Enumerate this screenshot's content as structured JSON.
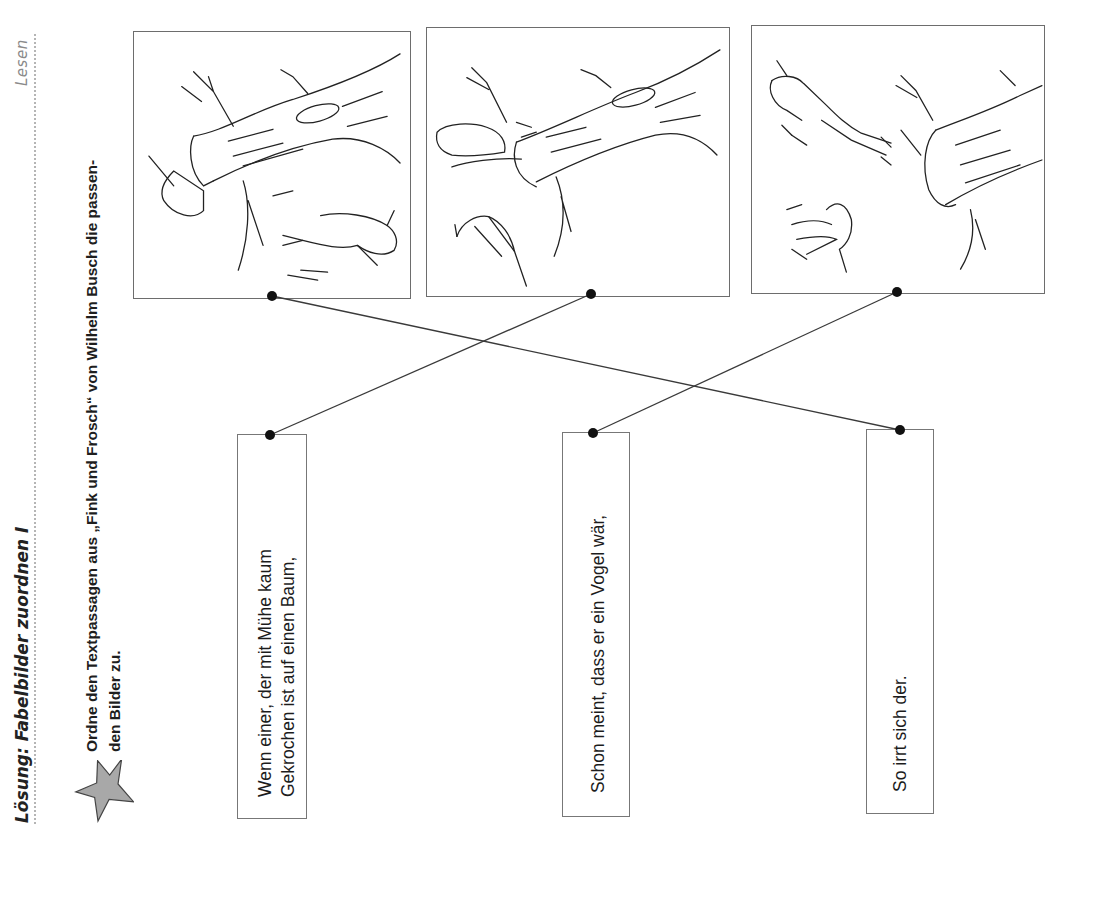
{
  "header": {
    "section_label": "Lesen",
    "title": "Lösung: Fabelbilder zuordnen I"
  },
  "task": {
    "icon": "star-icon",
    "instruction_line1": "Ordne den Textpassagen aus „Fink und Frosch“ von Wilhelm Busch die passen-",
    "instruction_line2": "den Bilder zu."
  },
  "pictures": [
    {
      "id": "picture-1",
      "description": "Frosch springt vom Ast, Fink sitzt am Baumstamm"
    },
    {
      "id": "picture-2",
      "description": "Frosch klettert auf den Ast, Fink sitzt darunter"
    },
    {
      "id": "picture-3",
      "description": "Frosch fällt vom Baum, Fink fliegt davon"
    }
  ],
  "passages": [
    {
      "lines": [
        "Wenn einer, der mit Mühe kaum",
        "Gekrochen ist auf einen Baum,"
      ]
    },
    {
      "lines": [
        "Schon meint, dass er ein Vogel wär,"
      ]
    },
    {
      "lines": [
        "So irrt sich der."
      ]
    }
  ],
  "solution": [
    {
      "picture": 1,
      "passage": 3
    },
    {
      "picture": 2,
      "passage": 1
    },
    {
      "picture": 3,
      "passage": 2
    }
  ],
  "colors": {
    "line": "#3a3a3a",
    "dot": "#111111",
    "star_fill": "#a8a8a8",
    "border": "#6d6d6d"
  }
}
